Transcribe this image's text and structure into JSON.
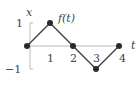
{
  "chart_data": {
    "type": "line",
    "title": "",
    "xlabel": "t",
    "ylabel": "x",
    "series": [
      {
        "name": "f(t)",
        "x": [
          0,
          1,
          2,
          3,
          4
        ],
        "y": [
          0,
          1,
          0,
          -1,
          0
        ],
        "markers": true
      }
    ],
    "xlim": [
      0,
      4
    ],
    "ylim": [
      -1,
      1
    ],
    "xticks": [
      1,
      2,
      3,
      4
    ],
    "xtick_labels": [
      "1",
      "2",
      "3",
      "4"
    ],
    "yticks": [
      1,
      -1
    ],
    "ytick_labels": [
      "1",
      "−1"
    ],
    "annotations": [
      {
        "text": "f(t)",
        "near": "peak at t=1"
      }
    ],
    "grid": false,
    "legend": "none",
    "colors": {
      "line": "#3a3a3a",
      "marker": "#2a2a2a",
      "axis": "#bbbbbb",
      "text": "#444444"
    }
  }
}
